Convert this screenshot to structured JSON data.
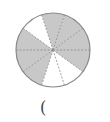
{
  "diagram": {
    "type": "fraction-circle",
    "center": [
      53,
      50
    ],
    "radius": 37,
    "total_parts": 10,
    "shaded_parts": 7,
    "unshaded_parts": 3,
    "sectors": [
      {
        "start_deg": 0,
        "end_deg": 36,
        "shaded": true
      },
      {
        "start_deg": 36,
        "end_deg": 72,
        "shaded": true
      },
      {
        "start_deg": 72,
        "end_deg": 108,
        "shaded": true
      },
      {
        "start_deg": 108,
        "end_deg": 144,
        "shaded": false
      },
      {
        "start_deg": 144,
        "end_deg": 180,
        "shaded": true
      },
      {
        "start_deg": 180,
        "end_deg": 216,
        "shaded": true
      },
      {
        "start_deg": 216,
        "end_deg": 252,
        "shaded": true
      },
      {
        "start_deg": 252,
        "end_deg": 288,
        "shaded": false
      },
      {
        "start_deg": 288,
        "end_deg": 324,
        "shaded": false
      },
      {
        "start_deg": 324,
        "end_deg": 360,
        "shaded": true
      }
    ],
    "colors": {
      "shaded": "#c8c8c8",
      "unshaded": "#ffffff",
      "outline": "#8a8a8a",
      "divider": "#8a8a8a"
    }
  },
  "answer": {
    "open_paren": "("
  }
}
